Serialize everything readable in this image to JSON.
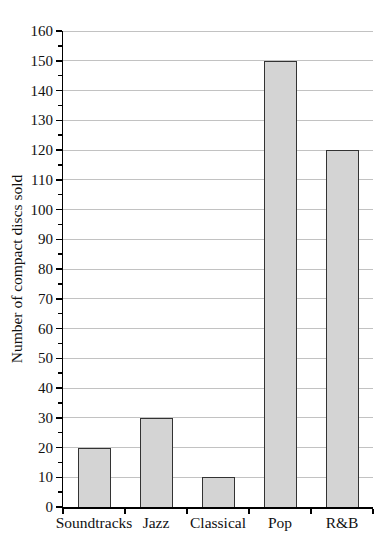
{
  "chart_data": {
    "type": "bar",
    "title": "",
    "categories": [
      "Soundtracks",
      "Jazz",
      "Classical",
      "Pop",
      "R&B"
    ],
    "values": [
      20,
      30,
      10,
      150,
      120
    ],
    "xlabel": "",
    "ylabel": "Number of compact discs sold",
    "ylim": [
      0,
      160
    ],
    "ytick_major": 10,
    "ytick_minor": 5,
    "grid": "horizontal-major",
    "legend": "none",
    "colors": {
      "bar_fill": "#d4d4d4",
      "bar_border": "#333333",
      "gridline": "#c2c2c2",
      "axis": "#000000",
      "text": "#111111",
      "background": "#ffffff"
    }
  }
}
